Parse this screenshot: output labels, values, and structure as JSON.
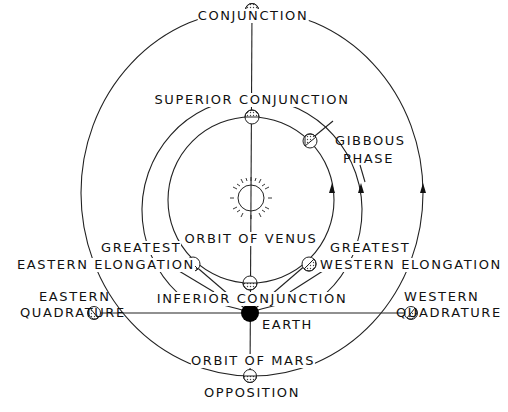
{
  "diagram": {
    "colors": {
      "line": "#222222",
      "earth": "#000000",
      "background": "#ffffff"
    },
    "labels": {
      "conjunction": "CONJUNCTION",
      "superior_conjunction": "SUPERIOR CONJUNCTION",
      "gibbous_phase_1": "GIBBOUS",
      "gibbous_phase_2": "PHASE",
      "orbit_of_venus": "ORBIT OF VENUS",
      "greatest_eastern_1": "GREATEST",
      "greatest_eastern_2": "EASTERN ELONGATION",
      "greatest_western_1": "GREATEST",
      "greatest_western_2": "WESTERN ELONGATION",
      "inferior_conjunction": "INFERIOR CONJUNCTION",
      "eastern_quadrature_1": "EASTERN",
      "eastern_quadrature_2": "QUADRATURE",
      "western_quadrature_1": "WESTERN",
      "western_quadrature_2": "QUADRATURE",
      "earth": "EARTH",
      "orbit_of_mars": "ORBIT OF MARS",
      "opposition": "OPPOSITION"
    },
    "icons": {
      "sun": "sun-icon",
      "earth": "earth-icon",
      "planet": "planet-phase-icon",
      "arrow": "direction-arrow-icon"
    }
  }
}
